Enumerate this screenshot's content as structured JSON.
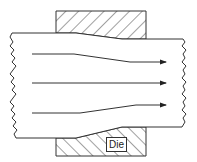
{
  "diagram": {
    "type": "extrusion/drawing die flow schematic",
    "labels": {
      "die": "Die"
    },
    "components": [
      {
        "name": "top-die",
        "style": "hatched"
      },
      {
        "name": "bottom-die",
        "style": "hatched"
      },
      {
        "name": "workpiece",
        "style": "wavy-break edges"
      }
    ],
    "flow_arrows": [
      {
        "name": "top-flow-line",
        "path": "converges downward"
      },
      {
        "name": "middle-flow-line",
        "path": "straight"
      },
      {
        "name": "bottom-flow-line",
        "path": "converges upward"
      }
    ],
    "colors": {
      "stroke": "#333333",
      "background": "#ffffff"
    }
  }
}
